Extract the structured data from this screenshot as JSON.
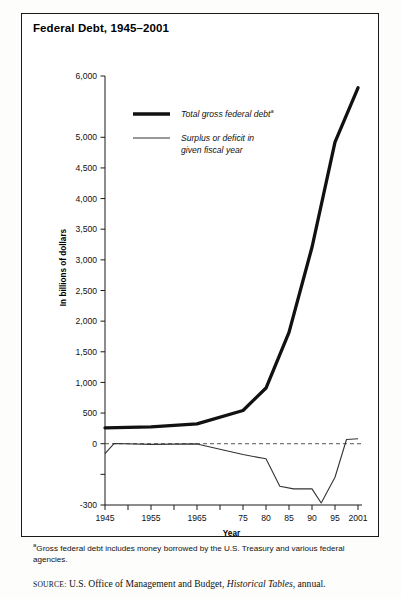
{
  "figure": {
    "title": "Federal Debt, 1945–2001",
    "footnote_marker": "a",
    "footnote_text": "Gross federal debt includes money borrowed by the U.S. Treasury and various federal agencies.",
    "source_label": "SOURCE:",
    "source_text_1": "U.S. Office of Management and Budget,",
    "source_italic": "Historical Tables",
    "source_text_2": ", annual."
  },
  "colors": {
    "debt_line": "#111111",
    "deficit_line": "#333333",
    "zero_line": "#555555",
    "axis": "#1a1a1a",
    "frame": "#1a1a1a",
    "background": "#ffffff"
  },
  "chart_data": {
    "type": "line",
    "title": "Federal Debt, 1945–2001",
    "xlabel": "Year",
    "ylabel": "In billions of dollars",
    "xlim": [
      1945,
      2001
    ],
    "ylim": [
      -300,
      6000
    ],
    "grid": false,
    "legend_position": "upper-left-inside",
    "y_ticks": [
      {
        "value": 6000,
        "label": "6,000"
      },
      {
        "value": 5000,
        "label": "5,000"
      },
      {
        "value": 4500,
        "label": "4,500"
      },
      {
        "value": 4000,
        "label": "4,000"
      },
      {
        "value": 3500,
        "label": "3,500"
      },
      {
        "value": 3000,
        "label": "3,000"
      },
      {
        "value": 2500,
        "label": "2,500"
      },
      {
        "value": 2000,
        "label": "2,000"
      },
      {
        "value": 1500,
        "label": "1,500"
      },
      {
        "value": 1000,
        "label": "1,000"
      },
      {
        "value": 500,
        "label": "500"
      },
      {
        "value": 0,
        "label": "0"
      },
      {
        "value": -150,
        "label": ""
      },
      {
        "value": -300,
        "label": "-300"
      }
    ],
    "x_ticks": [
      {
        "value": 1945,
        "label": "1945"
      },
      {
        "value": 1950,
        "label": ""
      },
      {
        "value": 1955,
        "label": "1955"
      },
      {
        "value": 1960,
        "label": ""
      },
      {
        "value": 1965,
        "label": "1965"
      },
      {
        "value": 1970,
        "label": ""
      },
      {
        "value": 1975,
        "label": "75"
      },
      {
        "value": 1980,
        "label": "80"
      },
      {
        "value": 1985,
        "label": "85"
      },
      {
        "value": 1990,
        "label": "90"
      },
      {
        "value": 1995,
        "label": "95"
      },
      {
        "value": 2001,
        "label": "2001"
      }
    ],
    "series": [
      {
        "name": "Total gross federal debt",
        "name_superscript": "a",
        "style": "thick",
        "x": [
          1945,
          1955,
          1965,
          1975,
          1980,
          1985,
          1990,
          1995,
          2001
        ],
        "values": [
          260,
          274,
          323,
          542,
          909,
          1817,
          3206,
          4921,
          5807
        ]
      },
      {
        "name": "Surplus or deficit in given fiscal year",
        "name_line_1": "Surplus or deficit in",
        "name_line_2": "given fiscal year",
        "style": "thin",
        "x": [
          1945,
          1947,
          1955,
          1965,
          1975,
          1980,
          1983,
          1986,
          1990,
          1992,
          1995,
          1998,
          2001
        ],
        "values": [
          -48,
          4,
          -3,
          -1,
          -53,
          -74,
          -208,
          -221,
          -221,
          -290,
          -164,
          69,
          80
        ]
      }
    ],
    "annotations": [
      {
        "type": "zero-reference-line",
        "value": 0,
        "style": "dashed"
      }
    ]
  },
  "legend": {
    "items": [
      {
        "swatch": "thick-line-swatch",
        "label": "Total gross federal debt",
        "superscript": "a"
      },
      {
        "swatch": "thin-line-swatch",
        "label_line_1": "Surplus or deficit in",
        "label_line_2": "given fiscal year"
      }
    ]
  }
}
